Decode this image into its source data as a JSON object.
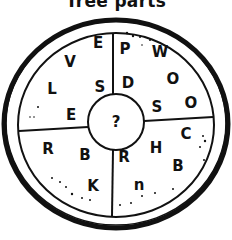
{
  "title": "Tree parts",
  "center": "?",
  "letters": [
    {
      "ch": "E",
      "x": 98,
      "y": 43
    },
    {
      "ch": "V",
      "x": 70,
      "y": 62
    },
    {
      "ch": "L",
      "x": 52,
      "y": 89
    },
    {
      "ch": "S",
      "x": 100,
      "y": 87
    },
    {
      "ch": "E",
      "x": 71,
      "y": 115
    },
    {
      "ch": "P",
      "x": 125,
      "y": 49
    },
    {
      "ch": "W",
      "x": 160,
      "y": 52
    },
    {
      "ch": "D",
      "x": 128,
      "y": 83
    },
    {
      "ch": "O",
      "x": 173,
      "y": 79
    },
    {
      "ch": "S",
      "x": 157,
      "y": 107
    },
    {
      "ch": "O",
      "x": 191,
      "y": 103
    },
    {
      "ch": "R",
      "x": 48,
      "y": 149
    },
    {
      "ch": "B",
      "x": 85,
      "y": 155
    },
    {
      "ch": "K",
      "x": 93,
      "y": 186
    },
    {
      "ch": "R",
      "x": 124,
      "y": 157
    },
    {
      "ch": "H",
      "x": 156,
      "y": 148
    },
    {
      "ch": "C",
      "x": 186,
      "y": 134
    },
    {
      "ch": "B",
      "x": 178,
      "y": 166
    },
    {
      "ch": "n",
      "x": 139,
      "y": 185
    }
  ]
}
